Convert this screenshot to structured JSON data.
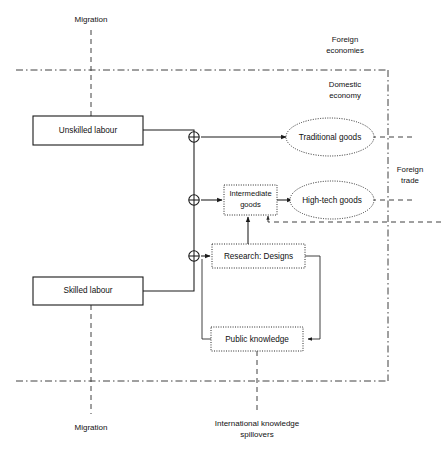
{
  "diagram": {
    "nodes": {
      "unskilled_labour": "Unskilled labour",
      "skilled_labour": "Skilled labour",
      "traditional_goods": "Traditional goods",
      "high_tech_goods": "High-tech goods",
      "intermediate_goods_line1": "Intermediate",
      "intermediate_goods_line2": "goods",
      "research_designs": "Research: Designs",
      "public_knowledge": "Public knowledge"
    },
    "zone_labels": {
      "foreign_economies_line1": "Foreign",
      "foreign_economies_line2": "economies",
      "domestic_economy_line1": "Domestic",
      "domestic_economy_line2": "economy",
      "foreign_trade_line1": "Foreign",
      "foreign_trade_line2": "trade"
    },
    "flow_labels": {
      "migration_top": "Migration",
      "migration_bottom": "Migration",
      "spillovers_line1": "International knowledge",
      "spillovers_line2": "spillovers"
    },
    "colors": {
      "background": "#ffffff",
      "stroke": "#1a1a1a",
      "stroke_light": "#2b2b2b",
      "text": "#111111"
    }
  }
}
